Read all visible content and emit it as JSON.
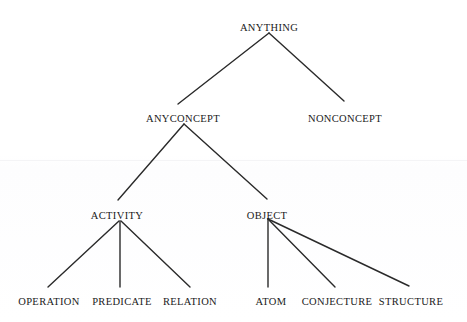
{
  "diagram": {
    "type": "tree",
    "background_color": "#fefefe",
    "line_color": "#2a2a2a",
    "text_color": "#1a1a1a",
    "nodes": [
      {
        "id": "anything",
        "label": "ANYTHING",
        "x": 269,
        "y": 22,
        "level": 0
      },
      {
        "id": "anyconcept",
        "label": "ANYCONCEPT",
        "x": 183,
        "y": 113,
        "level": 1
      },
      {
        "id": "nonconcept",
        "label": "NONCONCEPT",
        "x": 345,
        "y": 113,
        "level": 1
      },
      {
        "id": "activity",
        "label": "ACTIVITY",
        "x": 117,
        "y": 210,
        "level": 2
      },
      {
        "id": "object",
        "label": "OBJECT",
        "x": 267,
        "y": 210,
        "level": 2
      },
      {
        "id": "operation",
        "label": "OPERATION",
        "x": 49,
        "y": 296,
        "level": 3
      },
      {
        "id": "predicate",
        "label": "PREDICATE",
        "x": 122,
        "y": 296,
        "level": 3
      },
      {
        "id": "relation",
        "label": "RELATION",
        "x": 190,
        "y": 296,
        "level": 3
      },
      {
        "id": "atom",
        "label": "ATOM",
        "x": 271,
        "y": 296,
        "level": 3
      },
      {
        "id": "conjecture",
        "label": "CONJECTURE",
        "x": 337,
        "y": 296,
        "level": 3
      },
      {
        "id": "structure",
        "label": "STRUCTURE",
        "x": 411,
        "y": 296,
        "level": 3
      }
    ],
    "edges": [
      {
        "id": "edge-anything-anyconcept",
        "from": "anything",
        "to": "anyconcept",
        "x1": 269,
        "y1": 33,
        "x2": 178,
        "y2": 104
      },
      {
        "id": "edge-anything-nonconcept",
        "from": "anything",
        "to": "nonconcept",
        "x1": 269,
        "y1": 33,
        "x2": 344,
        "y2": 101
      },
      {
        "id": "edge-anyconcept-activity",
        "from": "anyconcept",
        "to": "activity",
        "x1": 184,
        "y1": 124,
        "x2": 118,
        "y2": 200
      },
      {
        "id": "edge-anyconcept-object",
        "from": "anyconcept",
        "to": "object",
        "x1": 184,
        "y1": 124,
        "x2": 267,
        "y2": 199
      },
      {
        "id": "edge-activity-operation",
        "from": "activity",
        "to": "operation",
        "x1": 119,
        "y1": 221,
        "x2": 48,
        "y2": 287
      },
      {
        "id": "edge-activity-predicate",
        "from": "activity",
        "to": "predicate",
        "x1": 120,
        "y1": 221,
        "x2": 120,
        "y2": 287
      },
      {
        "id": "edge-activity-relation",
        "from": "activity",
        "to": "relation",
        "x1": 121,
        "y1": 221,
        "x2": 190,
        "y2": 287
      },
      {
        "id": "edge-object-atom",
        "from": "object",
        "to": "atom",
        "x1": 268,
        "y1": 219,
        "x2": 268,
        "y2": 287
      },
      {
        "id": "edge-object-conjecture",
        "from": "object",
        "to": "conjecture",
        "x1": 268,
        "y1": 219,
        "x2": 335,
        "y2": 287
      },
      {
        "id": "edge-object-structure",
        "from": "object",
        "to": "structure",
        "x1": 268,
        "y1": 219,
        "x2": 409,
        "y2": 286
      }
    ]
  }
}
